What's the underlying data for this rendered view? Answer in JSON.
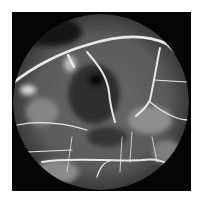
{
  "image": {
    "subject": "retinal fluorescein angiogram",
    "description": "Circular fundus view on black square background showing bright branching retinal vessels, hyperfluorescent leakage regions and dark non-perfused patches",
    "colors": {
      "background": "#ffffff",
      "frame": "#050505",
      "vessel": "#e8e8e8",
      "fundus": "#6a6a6a"
    }
  }
}
